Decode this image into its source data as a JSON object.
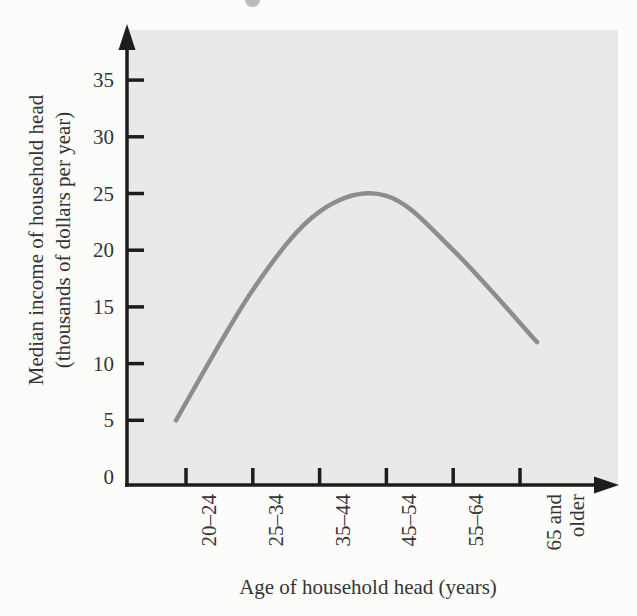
{
  "figure_kind": "textbook line chart scan",
  "colors": {
    "page_background": "#fcfcfa",
    "plot_background": "#e9e9e7",
    "axis": "#1d1d1d",
    "curve": "#8d8d8d",
    "text": "#343434"
  },
  "chart_data": {
    "type": "line",
    "title": "",
    "xlabel": "Age of household head (years)",
    "ylabel": "Median income of household head\n(thousands of dollars per year)",
    "categories": [
      "20–24",
      "25–34",
      "35–44",
      "45–54",
      "55–64",
      "65 and\nolder"
    ],
    "values": [
      5.0,
      16.5,
      23.4,
      24.8,
      20.0,
      11.9
    ],
    "yticks": [
      0,
      5,
      10,
      15,
      20,
      25,
      30,
      35
    ],
    "ylim": [
      0,
      38.5
    ],
    "grid": false,
    "legend": null,
    "curve_style": "single smooth gray curve, rises from ~5 at ages 20–24 to a peak of ~25 at ages 45–54, then falls to ~12 for 65 and older",
    "x_tick_label_rotation_deg": 90
  }
}
